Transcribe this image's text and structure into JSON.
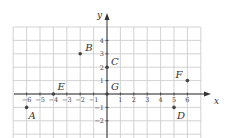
{
  "chart_data": {
    "type": "scatter",
    "title": "",
    "xlabel": "x",
    "ylabel": "y",
    "xlim": [
      -7,
      7
    ],
    "ylim": [
      -3,
      5
    ],
    "grid": true,
    "x_ticks": [
      "-6",
      "-5",
      "-4",
      "-3",
      "-2",
      "-1",
      "1",
      "2",
      "3",
      "4",
      "5",
      "6"
    ],
    "y_ticks": [
      "4",
      "3",
      "2",
      "1",
      "1",
      "2"
    ],
    "y_tick_values": [
      4,
      3,
      2,
      1,
      -1,
      -2
    ],
    "points": [
      {
        "label": "A",
        "x": -6,
        "y": -1
      },
      {
        "label": "B",
        "x": -2,
        "y": 3
      },
      {
        "label": "C",
        "x": 0,
        "y": 2
      },
      {
        "label": "D",
        "x": 5,
        "y": -1
      },
      {
        "label": "E",
        "x": -4,
        "y": 0
      },
      {
        "label": "F",
        "x": 6,
        "y": 1
      },
      {
        "label": "G",
        "x": 0,
        "y": 0
      }
    ]
  },
  "axis_labels": {
    "x": "x",
    "y": "y"
  }
}
